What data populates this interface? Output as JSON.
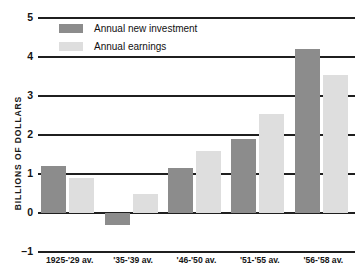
{
  "chart_data": {
    "type": "bar",
    "title": "",
    "xlabel": "",
    "ylabel": "BILLIONS OF DOLLARS",
    "categories": [
      "1925-'29 av.",
      "'35-'39 av.",
      "'46-'50 av.",
      "'51-'55 av.",
      "'56-'58 av."
    ],
    "series": [
      {
        "name": "Annual new investment",
        "color": "#8c8c8c",
        "values": [
          1.2,
          -0.3,
          1.15,
          1.9,
          4.2
        ]
      },
      {
        "name": "Annual earnings",
        "color": "#dedede",
        "values": [
          0.9,
          0.5,
          1.6,
          2.55,
          3.55
        ]
      }
    ],
    "ylim": [
      -1,
      5
    ],
    "yticks": [
      5,
      4,
      3,
      2,
      1,
      0,
      -1
    ],
    "ytick_labels": [
      "5",
      "4",
      "3",
      "2",
      "1",
      "0",
      "–1"
    ],
    "grid": true,
    "legend_position": "top-left"
  },
  "legend": {
    "items": [
      {
        "label": "Annual new investment",
        "swatch": "dark"
      },
      {
        "label": "Annual earnings",
        "swatch": "light"
      }
    ]
  },
  "axis": {
    "y_title": "BILLIONS OF DOLLARS"
  }
}
